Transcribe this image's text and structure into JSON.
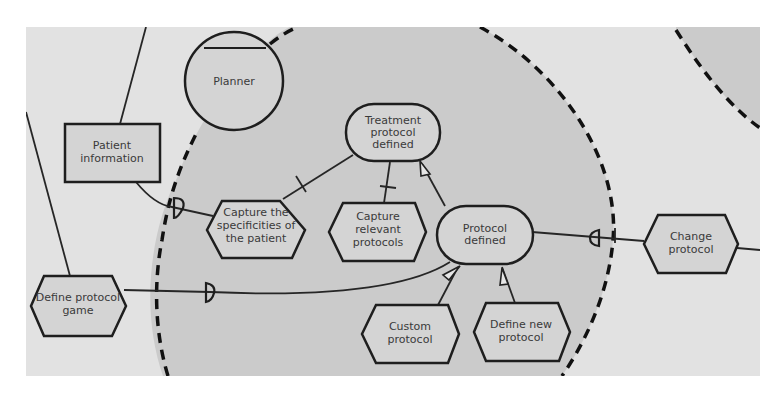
{
  "diagram": {
    "type": "goal-actor dependency diagram",
    "colors": {
      "background": "#e2e2e2",
      "boundary_fill": "#cbcbcb",
      "node_fill": "#d4d4d4",
      "stroke": "#1e1e1e"
    },
    "actor": {
      "label": "Planner"
    },
    "resource": {
      "label": [
        "Patient",
        "information"
      ]
    },
    "goals": {
      "treatment_protocol_defined": {
        "label": [
          "Treatment",
          "protocol",
          "defined"
        ]
      },
      "protocol_defined": {
        "label": [
          "Protocol",
          "defined"
        ]
      }
    },
    "tasks": {
      "capture_specificities": {
        "label": [
          "Capture the",
          "specificities of",
          "the patient"
        ]
      },
      "capture_relevant_protocols": {
        "label": [
          "Capture",
          "relevant",
          "protocols"
        ]
      },
      "custom_protocol": {
        "label": [
          "Custom",
          "protocol"
        ]
      },
      "define_new_protocol": {
        "label": [
          "Define new",
          "protocol"
        ]
      },
      "change_protocol": {
        "label": [
          "Change",
          "protocol"
        ]
      },
      "define_protocol_game": {
        "label": [
          "Define protocol",
          "game"
        ]
      }
    },
    "links": [
      {
        "from": "capture_specificities",
        "to": "treatment_protocol_defined",
        "kind": "decomposition"
      },
      {
        "from": "capture_relevant_protocols",
        "to": "treatment_protocol_defined",
        "kind": "decomposition"
      },
      {
        "from": "protocol_defined",
        "to": "treatment_protocol_defined",
        "kind": "means-end"
      },
      {
        "from": "custom_protocol",
        "to": "protocol_defined",
        "kind": "means-end"
      },
      {
        "from": "define_new_protocol",
        "to": "protocol_defined",
        "kind": "means-end"
      },
      {
        "from": "resource",
        "to": "capture_specificities",
        "kind": "dependency"
      },
      {
        "from": "define_protocol_game",
        "to": "protocol_defined",
        "kind": "dependency"
      },
      {
        "from": "protocol_defined",
        "to": "change_protocol",
        "kind": "dependency"
      }
    ]
  }
}
